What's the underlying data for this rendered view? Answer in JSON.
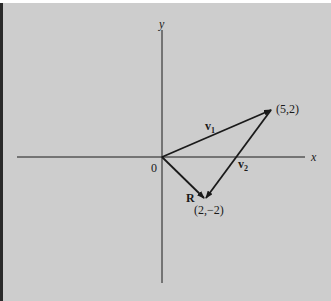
{
  "diagram": {
    "title": "",
    "axes": {
      "x_label": "x",
      "y_label": "y",
      "origin_label": "0"
    },
    "vectors": [
      {
        "id": "v1",
        "label": "v",
        "subscript": "1",
        "from": [
          0,
          0
        ],
        "to": [
          5,
          2
        ]
      },
      {
        "id": "v2",
        "label": "v",
        "subscript": "2",
        "from": [
          5,
          2
        ],
        "to": [
          2,
          -2
        ]
      },
      {
        "id": "R",
        "label": "R",
        "subscript": "",
        "from": [
          0,
          0
        ],
        "to": [
          2,
          -2
        ]
      }
    ],
    "points": [
      {
        "id": "p1",
        "coords": [
          5,
          2
        ],
        "label": "(5,2)"
      },
      {
        "id": "p2",
        "coords": [
          2,
          -2
        ],
        "label": "(2,−2)"
      }
    ],
    "colors": {
      "background": "#cdcdcd",
      "ink": "#1a1a1a",
      "left_border": "#2a2a2a"
    }
  }
}
